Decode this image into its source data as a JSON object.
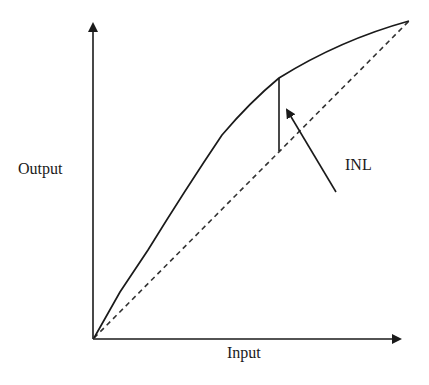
{
  "diagram": {
    "y_axis_label": "Output",
    "x_axis_label": "Input",
    "annotation_label": "INL",
    "line_color": "#1a1a1a",
    "series": [
      {
        "name": "Actual transfer curve",
        "style": "solid",
        "shape": "concave"
      },
      {
        "name": "Ideal transfer line",
        "style": "dashed",
        "shape": "straight"
      }
    ]
  }
}
